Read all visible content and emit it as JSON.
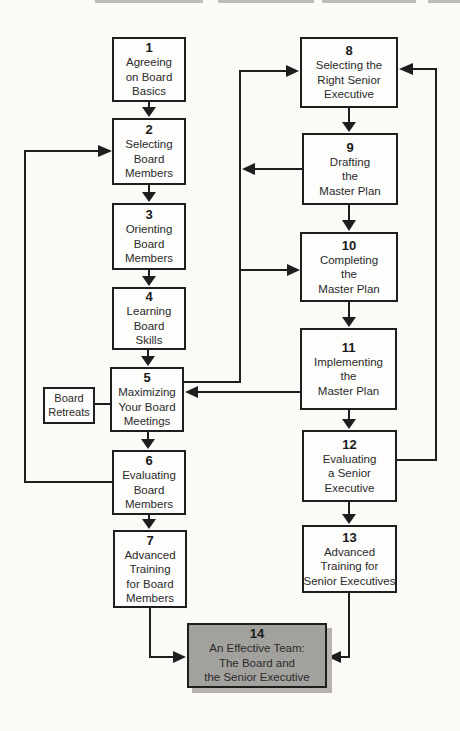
{
  "diagram_title": "Board development flowchart",
  "colors": {
    "line": "#1e1e1e",
    "box_fill": "#fdfdfc",
    "highlight_fill": "#a3a19e",
    "background": "#fbfaf7"
  },
  "boxes": [
    {
      "num": "1",
      "label": "Agreeing\non Board\nBasics"
    },
    {
      "num": "2",
      "label": "Selecting\nBoard\nMembers"
    },
    {
      "num": "3",
      "label": "Orienting\nBoard\nMembers"
    },
    {
      "num": "4",
      "label": "Learning\nBoard\nSkills"
    },
    {
      "num": "5",
      "label": "Maximizing\nYour Board\nMeetings"
    },
    {
      "num": "6",
      "label": "Evaluating\nBoard\nMembers"
    },
    {
      "num": "7",
      "label": "Advanced\nTraining\nfor Board\nMembers"
    },
    {
      "num": "8",
      "label": "Selecting the\nRight Senior\nExecutive"
    },
    {
      "num": "9",
      "label": "Drafting\nthe\nMaster Plan"
    },
    {
      "num": "10",
      "label": "Completing\nthe\nMaster Plan"
    },
    {
      "num": "11",
      "label": "Implementing\nthe\nMaster Plan"
    },
    {
      "num": "12",
      "label": "Evaluating\na Senior\nExecutive"
    },
    {
      "num": "13",
      "label": "Advanced\nTraining for\nSenior Executives"
    },
    {
      "num": "14",
      "label": "An Effective Team:\nThe Board and\nthe Senior Executive"
    }
  ],
  "side_box": {
    "label": "Board\nRetreats"
  }
}
